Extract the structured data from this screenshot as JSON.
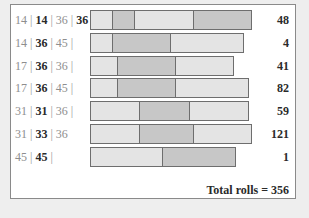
{
  "chart_data": {
    "type": "bar",
    "orientation": "horizontal",
    "stacked": true,
    "title": "",
    "xlabel": "",
    "ylabel": "",
    "grid": false,
    "legend": null,
    "categories": [
      "14 | 14 | 36 | 36",
      "14 | 36 | 45 |",
      "17 | 36 | 36 |",
      "17 | 36 | 45 |",
      "31 | 31 | 36 |",
      "31 | 33 | 36",
      "45 | 45 |"
    ],
    "values": [
      48,
      4,
      41,
      82,
      59,
      121,
      1
    ],
    "rows": [
      {
        "parts": [
          {
            "text": "14",
            "bold": false
          },
          {
            "text": "14",
            "bold": true
          },
          {
            "text": "36",
            "bold": false
          },
          {
            "text": "36",
            "bold": true
          }
        ],
        "trailing_sep": false,
        "segments": [
          14,
          14,
          36,
          36
        ],
        "count": "48"
      },
      {
        "parts": [
          {
            "text": "14",
            "bold": false
          },
          {
            "text": "36",
            "bold": true
          },
          {
            "text": "45",
            "bold": false
          }
        ],
        "trailing_sep": true,
        "segments": [
          14,
          36,
          45
        ],
        "count": "4"
      },
      {
        "parts": [
          {
            "text": "17",
            "bold": false
          },
          {
            "text": "36",
            "bold": true
          },
          {
            "text": "36",
            "bold": false
          }
        ],
        "trailing_sep": true,
        "segments": [
          17,
          36,
          36
        ],
        "count": "41"
      },
      {
        "parts": [
          {
            "text": "17",
            "bold": false
          },
          {
            "text": "36",
            "bold": true
          },
          {
            "text": "45",
            "bold": false
          }
        ],
        "trailing_sep": true,
        "segments": [
          17,
          36,
          45
        ],
        "count": "82"
      },
      {
        "parts": [
          {
            "text": "31",
            "bold": false
          },
          {
            "text": "31",
            "bold": true
          },
          {
            "text": "36",
            "bold": false
          }
        ],
        "trailing_sep": true,
        "segments": [
          31,
          31,
          36
        ],
        "count": "59"
      },
      {
        "parts": [
          {
            "text": "31",
            "bold": false
          },
          {
            "text": "33",
            "bold": true
          },
          {
            "text": "36",
            "bold": false
          }
        ],
        "trailing_sep": false,
        "segments": [
          31,
          33,
          36
        ],
        "count": "121"
      },
      {
        "parts": [
          {
            "text": "45",
            "bold": false
          },
          {
            "text": "45",
            "bold": true
          }
        ],
        "trailing_sep": true,
        "segments": [
          45,
          45
        ],
        "count": "1"
      }
    ],
    "separator": " | ",
    "total_label": "Total rolls = 356",
    "total": 356,
    "colors": {
      "light_segment": "#e4e4e4",
      "dark_segment": "#c7c7c7",
      "segment_border": "#6e6e6e"
    }
  }
}
